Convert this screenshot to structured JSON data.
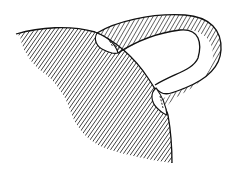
{
  "figure": {
    "colors": {
      "background": "#ffffff",
      "stroke": "#111111",
      "disk_fill": "#ffffff"
    },
    "parts": {
      "surface": "hatched-sheet",
      "handle": "hatched-band",
      "attach_disk_1": "upper-disk",
      "attach_disk_2": "lower-disk"
    }
  }
}
